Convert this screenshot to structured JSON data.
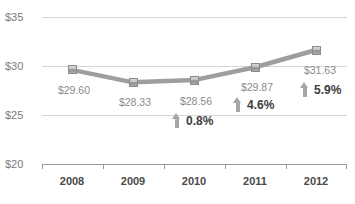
{
  "chart_data": {
    "type": "line",
    "title": "",
    "xlabel": "",
    "ylabel": "",
    "categories": [
      "2008",
      "2009",
      "2010",
      "2011",
      "2012"
    ],
    "values": [
      29.6,
      28.33,
      28.56,
      29.87,
      31.63
    ],
    "point_labels": [
      "$29.60",
      "$28.33",
      "$28.56",
      "$29.87",
      "$31.63"
    ],
    "ylim": [
      20,
      35
    ],
    "y_ticks": [
      20,
      25,
      30,
      35
    ],
    "y_tick_labels": [
      "$20",
      "$25",
      "$30",
      "$35"
    ],
    "grid": true,
    "legend": "none",
    "series": [
      {
        "name": "value",
        "values": [
          29.6,
          28.33,
          28.56,
          29.87,
          31.63
        ]
      }
    ],
    "annotations": [
      {
        "category": "2010",
        "arrow": "up-arrow-icon",
        "text": "0.8%"
      },
      {
        "category": "2011",
        "arrow": "up-arrow-icon",
        "text": "4.6%"
      },
      {
        "category": "2012",
        "arrow": "up-arrow-icon",
        "text": "5.9%"
      }
    ],
    "colors": {
      "line": "#9e9e9e",
      "marker": "#b0b0b0",
      "gridline": "#d6d6d6",
      "axis": "#9a9a9a",
      "value_label": "#8a8a8a",
      "category_label": "#4a4a4a",
      "annotation_text": "#3d3d3d",
      "arrow": "#a6a6a6",
      "background": "#ffffff"
    }
  }
}
